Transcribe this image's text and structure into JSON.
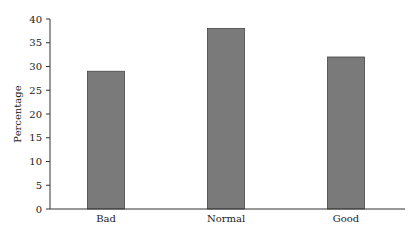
{
  "chart_data": {
    "type": "bar",
    "title": "",
    "xlabel": "",
    "ylabel": "Percentage",
    "categories": [
      "Bad",
      "Normal",
      "Good"
    ],
    "values": [
      29,
      38,
      32
    ],
    "ylim": [
      0,
      40
    ],
    "yticks": [
      0,
      5,
      10,
      15,
      20,
      25,
      30,
      35,
      40
    ],
    "grid": false,
    "legend": null,
    "bar_color": "#7a7a7a",
    "bar_edge_color": "#444444"
  }
}
